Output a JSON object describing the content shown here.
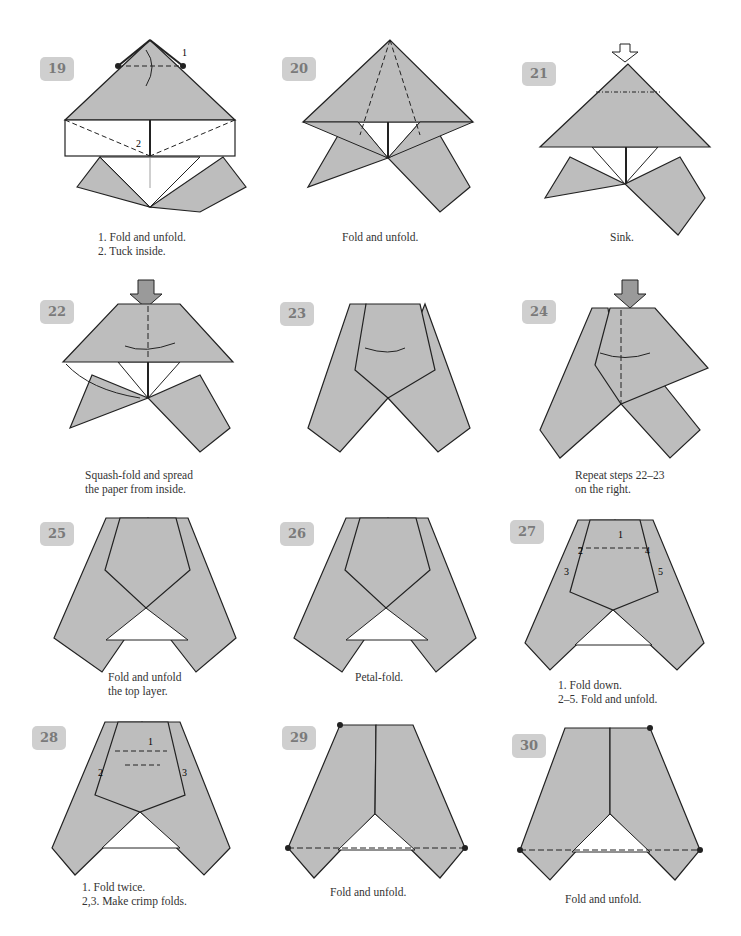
{
  "page": {
    "fill_color": "#bdbdbd",
    "line_color": "#222222",
    "badge_color": "#cfcfcf",
    "steps": [
      {
        "number": "19",
        "caption": "1. Fold and unfold.\n2. Tuck inside.",
        "labels": [
          "1",
          "2"
        ]
      },
      {
        "number": "20",
        "caption": "Fold and unfold.",
        "labels": []
      },
      {
        "number": "21",
        "caption": "Sink.",
        "labels": []
      },
      {
        "number": "22",
        "caption": "Squash-fold and spread\nthe paper from inside.",
        "labels": []
      },
      {
        "number": "23",
        "caption": "",
        "labels": []
      },
      {
        "number": "24",
        "caption": "Repeat steps 22–23\non the right.",
        "labels": []
      },
      {
        "number": "25",
        "caption": "Fold and unfold\nthe top layer.",
        "labels": []
      },
      {
        "number": "26",
        "caption": "Petal-fold.",
        "labels": []
      },
      {
        "number": "27",
        "caption": "1. Fold down.\n2–5. Fold and unfold.",
        "labels": [
          "1",
          "2",
          "3",
          "4",
          "5"
        ]
      },
      {
        "number": "28",
        "caption": "1. Fold twice.\n2,3. Make crimp folds.",
        "labels": [
          "1",
          "2",
          "3"
        ]
      },
      {
        "number": "29",
        "caption": "Fold and unfold.",
        "labels": []
      },
      {
        "number": "30",
        "caption": "Fold and unfold.",
        "labels": []
      }
    ]
  }
}
